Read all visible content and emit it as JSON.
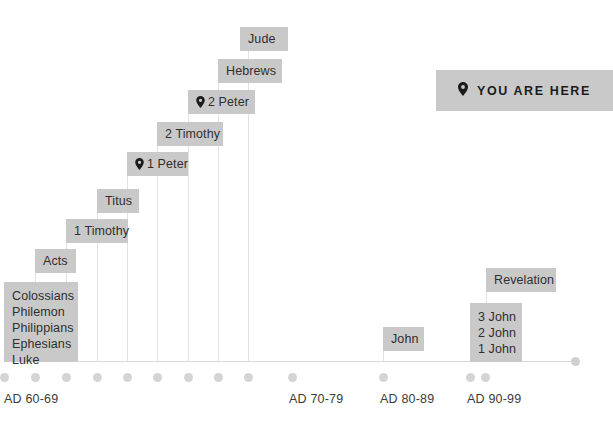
{
  "diagram": {
    "type": "timeline",
    "background_color": "#ffffff",
    "chip_color": "#c9c9c9",
    "axis_color": "#d9d9d9",
    "text_color": "#2f2f2f"
  },
  "legend": {
    "pin_icon": "map-pin-icon",
    "label": "YOU ARE HERE"
  },
  "axis": {
    "ticks": [
      {
        "label": "AD 60-69",
        "label_x": 4,
        "dot_x": 4
      },
      {
        "label": "",
        "label_x": 0,
        "dot_x": 35
      },
      {
        "label": "",
        "label_x": 0,
        "dot_x": 66
      },
      {
        "label": "",
        "label_x": 0,
        "dot_x": 97
      },
      {
        "label": "",
        "label_x": 0,
        "dot_x": 127
      },
      {
        "label": "",
        "label_x": 0,
        "dot_x": 157
      },
      {
        "label": "",
        "label_x": 0,
        "dot_x": 188
      },
      {
        "label": "",
        "label_x": 0,
        "dot_x": 218
      },
      {
        "label": "",
        "label_x": 0,
        "dot_x": 248
      },
      {
        "label": "AD 70-79",
        "label_x": 289,
        "dot_x": 292
      },
      {
        "label": "AD 80-89",
        "label_x": 380,
        "dot_x": 383
      },
      {
        "label": "AD 90-99",
        "label_x": 467,
        "dot_x": 470
      },
      {
        "label": "",
        "label_x": 0,
        "dot_x": 485
      }
    ]
  },
  "entries": [
    {
      "name": "colossians-group",
      "text": "Colossians\nPhilemon\nPhilippians\nEphesians\nLuke",
      "x": 4,
      "y": 282,
      "w": 74,
      "h": 80,
      "pin": false,
      "stem_x": 4,
      "stem_top": 362,
      "stem_h": 0
    },
    {
      "name": "acts",
      "text": "Acts",
      "x": 35,
      "y": 249,
      "w": 41,
      "h": 24,
      "pin": false,
      "stem_x": 35,
      "stem_top": 273,
      "stem_h": 89
    },
    {
      "name": "1-timothy",
      "text": "1 Timothy",
      "x": 66,
      "y": 219,
      "w": 62,
      "h": 24,
      "pin": false,
      "stem_x": 66,
      "stem_top": 243,
      "stem_h": 119
    },
    {
      "name": "titus",
      "text": "Titus",
      "x": 97,
      "y": 189,
      "w": 42,
      "h": 24,
      "pin": false,
      "stem_x": 97,
      "stem_top": 213,
      "stem_h": 149
    },
    {
      "name": "1-peter",
      "text": "1 Peter",
      "x": 127,
      "y": 152,
      "w": 61,
      "h": 24,
      "pin": true,
      "stem_x": 127,
      "stem_top": 176,
      "stem_h": 186
    },
    {
      "name": "2-timothy",
      "text": "2 Timothy",
      "x": 157,
      "y": 122,
      "w": 66,
      "h": 24,
      "pin": false,
      "stem_x": 157,
      "stem_top": 146,
      "stem_h": 216
    },
    {
      "name": "2-peter",
      "text": "2 Peter",
      "x": 188,
      "y": 90,
      "w": 67,
      "h": 24,
      "pin": true,
      "stem_x": 188,
      "stem_top": 114,
      "stem_h": 248
    },
    {
      "name": "hebrews",
      "text": "Hebrews",
      "x": 218,
      "y": 59,
      "w": 64,
      "h": 24,
      "pin": false,
      "stem_x": 218,
      "stem_top": 83,
      "stem_h": 279
    },
    {
      "name": "jude",
      "text": "Jude",
      "x": 240,
      "y": 27,
      "w": 48,
      "h": 24,
      "pin": false,
      "stem_x": 248,
      "stem_top": 51,
      "stem_h": 311
    },
    {
      "name": "john",
      "text": "John",
      "x": 383,
      "y": 327,
      "w": 41,
      "h": 24,
      "pin": false,
      "stem_x": 383,
      "stem_top": 351,
      "stem_h": 11
    },
    {
      "name": "johannine-epistles",
      "text": "3 John\n2 John\n1 John",
      "x": 470,
      "y": 303,
      "w": 52,
      "h": 59,
      "pin": false,
      "stem_x": 470,
      "stem_top": 362,
      "stem_h": 0
    },
    {
      "name": "revelation",
      "text": "Revelation",
      "x": 486,
      "y": 268,
      "w": 70,
      "h": 24,
      "pin": false,
      "stem_x": 486,
      "stem_top": 292,
      "stem_h": 70
    }
  ]
}
